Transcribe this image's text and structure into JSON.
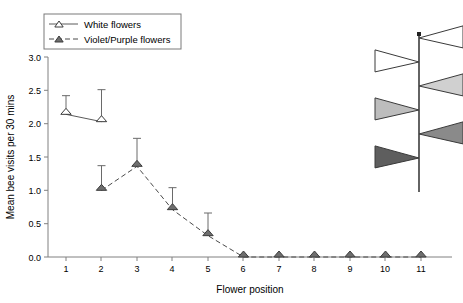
{
  "chart_data": {
    "type": "line",
    "title": "",
    "xlabel": "Flower position",
    "ylabel": "Mean bee visits per 30 mins",
    "xlim": [
      0.4,
      11.6
    ],
    "ylim": [
      0.0,
      3.0
    ],
    "xticks": [
      "1",
      "2",
      "3",
      "4",
      "5",
      "6",
      "7",
      "8",
      "9",
      "10",
      "11"
    ],
    "yticks": [
      "0.0",
      "0.5",
      "1.0",
      "1.5",
      "2.0",
      "2.5",
      "3.0"
    ],
    "grid": false,
    "legend_position": "top-left",
    "x": [
      1,
      2,
      3,
      4,
      5,
      6,
      7,
      8,
      9,
      10,
      11
    ],
    "series": [
      {
        "name": "White flowers",
        "marker": "open-triangle",
        "linestyle": "solid",
        "color": "#ffffff",
        "edgecolor": "#3c3c3c",
        "x": [
          1,
          2
        ],
        "values": [
          2.14,
          2.03
        ],
        "error_upper": [
          2.42,
          2.51
        ],
        "error_lower": [
          2.14,
          2.03
        ]
      },
      {
        "name": "Violet/Purple flowers",
        "marker": "filled-triangle",
        "linestyle": "dashed",
        "color": "#6e6e6e",
        "edgecolor": "#3c3c3c",
        "x": [
          2,
          3,
          4,
          5,
          6,
          7,
          8,
          9,
          10,
          11
        ],
        "values": [
          1.0,
          1.36,
          0.71,
          0.32,
          0.0,
          0.0,
          0.0,
          0.0,
          0.0,
          0.0
        ],
        "error_upper": [
          1.37,
          1.78,
          1.04,
          0.66,
          0.0,
          0.0,
          0.0,
          0.0,
          0.0,
          0.0
        ],
        "error_lower": [
          0.96,
          1.33,
          0.71,
          0.32,
          0.0,
          0.0,
          0.0,
          0.0,
          0.0,
          0.0
        ]
      }
    ]
  },
  "legend": {
    "entries": [
      {
        "label": "White flowers",
        "marker": "open-triangle",
        "linestyle": "solid"
      },
      {
        "label": "Violet/Purple flowers",
        "marker": "filled-triangle",
        "linestyle": "dashed"
      }
    ]
  },
  "inflorescence": {
    "name": "inflorescence-diagram",
    "description": "Vertical stem with alternating flag-shaped flowers shaded white to dark",
    "flowers": [
      {
        "position": 1,
        "side": "right",
        "shade": "#ffffff"
      },
      {
        "position": 2,
        "side": "left",
        "shade": "#ffffff"
      },
      {
        "position": 3,
        "side": "right",
        "shade": "#d0d0d0"
      },
      {
        "position": 4,
        "side": "left",
        "shade": "#bdbdbd"
      },
      {
        "position": 5,
        "side": "right",
        "shade": "#8a8a8a"
      },
      {
        "position": 6,
        "side": "left",
        "shade": "#5e5e5e"
      }
    ]
  },
  "colors": {
    "axis": "#808080",
    "white_series": "#ffffff",
    "violet_series": "#6e6e6e",
    "stem": "#222222"
  }
}
